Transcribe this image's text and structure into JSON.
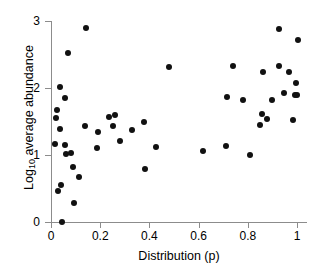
{
  "chart_data": {
    "type": "scatter",
    "title": "",
    "xlabel": "Distribution (p)",
    "ylabel": "Log10 average abundance",
    "ylabel_base": "Log",
    "ylabel_sub": "10",
    "ylabel_rest": " average abundance",
    "xlim": [
      0,
      1.04
    ],
    "ylim": [
      0,
      3
    ],
    "xticks": [
      0,
      0.2,
      0.4,
      0.6,
      0.8,
      1
    ],
    "xtick_labels": [
      "0",
      "0.2",
      "0.4",
      "0.6",
      "0.8",
      "1"
    ],
    "yticks": [
      0,
      1,
      2,
      3
    ],
    "ytick_labels": [
      "0",
      "1",
      "2",
      "3"
    ],
    "grid": false,
    "legend": null,
    "marker": "filled-circle",
    "marker_color": "#111111",
    "axis_color": "#8c8c8c",
    "background_color": "#ffffff",
    "points": [
      {
        "x": 0.016,
        "y": 1.17
      },
      {
        "x": 0.02,
        "y": 1.55
      },
      {
        "x": 0.023,
        "y": 1.67
      },
      {
        "x": 0.027,
        "y": 0.47
      },
      {
        "x": 0.035,
        "y": 2.02
      },
      {
        "x": 0.037,
        "y": 1.39
      },
      {
        "x": 0.039,
        "y": 0.55
      },
      {
        "x": 0.043,
        "y": 0.0
      },
      {
        "x": 0.055,
        "y": 1.85
      },
      {
        "x": 0.057,
        "y": 1.15
      },
      {
        "x": 0.062,
        "y": 1.01
      },
      {
        "x": 0.07,
        "y": 2.52
      },
      {
        "x": 0.082,
        "y": 1.03
      },
      {
        "x": 0.088,
        "y": 0.82
      },
      {
        "x": 0.092,
        "y": 0.28
      },
      {
        "x": 0.115,
        "y": 0.67
      },
      {
        "x": 0.138,
        "y": 1.43
      },
      {
        "x": 0.142,
        "y": 2.89
      },
      {
        "x": 0.185,
        "y": 1.1
      },
      {
        "x": 0.192,
        "y": 1.35
      },
      {
        "x": 0.235,
        "y": 1.57
      },
      {
        "x": 0.252,
        "y": 1.44
      },
      {
        "x": 0.258,
        "y": 1.59
      },
      {
        "x": 0.282,
        "y": 1.21
      },
      {
        "x": 0.33,
        "y": 1.37
      },
      {
        "x": 0.378,
        "y": 1.49
      },
      {
        "x": 0.382,
        "y": 0.79
      },
      {
        "x": 0.425,
        "y": 1.12
      },
      {
        "x": 0.478,
        "y": 2.32
      },
      {
        "x": 0.617,
        "y": 1.06
      },
      {
        "x": 0.712,
        "y": 1.13
      },
      {
        "x": 0.715,
        "y": 1.86
      },
      {
        "x": 0.738,
        "y": 2.33
      },
      {
        "x": 0.782,
        "y": 1.82
      },
      {
        "x": 0.81,
        "y": 1.0
      },
      {
        "x": 0.851,
        "y": 1.45
      },
      {
        "x": 0.856,
        "y": 1.61
      },
      {
        "x": 0.862,
        "y": 2.24
      },
      {
        "x": 0.878,
        "y": 1.53
      },
      {
        "x": 0.898,
        "y": 1.82
      },
      {
        "x": 0.925,
        "y": 2.88
      },
      {
        "x": 0.928,
        "y": 2.33
      },
      {
        "x": 0.945,
        "y": 1.92
      },
      {
        "x": 0.968,
        "y": 2.24
      },
      {
        "x": 0.985,
        "y": 1.52
      },
      {
        "x": 0.992,
        "y": 1.89
      },
      {
        "x": 0.996,
        "y": 2.08
      },
      {
        "x": 1.0,
        "y": 1.9
      },
      {
        "x": 1.002,
        "y": 2.72
      }
    ]
  }
}
